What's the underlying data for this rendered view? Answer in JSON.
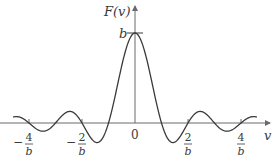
{
  "chart_data": {
    "type": "line",
    "title": "",
    "function": "F(v) = b·sinc(b·v)",
    "ylabel": "F(v)",
    "xlabel": "v",
    "peak_label": "b",
    "origin_label": "0",
    "x_ticks": [
      {
        "value": -4,
        "sign": "−",
        "num": "4",
        "den": "b"
      },
      {
        "value": -2,
        "sign": "−",
        "num": "2",
        "den": "b"
      },
      {
        "value": 2,
        "sign": "",
        "num": "2",
        "den": "b"
      },
      {
        "value": 4,
        "sign": "",
        "num": "4",
        "den": "b"
      }
    ],
    "x_units": "1/b",
    "xlim": [
      -4.6,
      4.6
    ],
    "ylim": [
      -0.22,
      1.0
    ],
    "zeros": [
      -4,
      -3,
      -2,
      -1,
      1,
      2,
      3,
      4
    ],
    "peak": {
      "x": 0,
      "y": 1
    },
    "first_minimum": {
      "x": 1.43,
      "y": -0.217
    },
    "grid": false,
    "legend": null
  },
  "colors": {
    "curve": "#3a3a3a",
    "axis": "#6a6a6a"
  }
}
